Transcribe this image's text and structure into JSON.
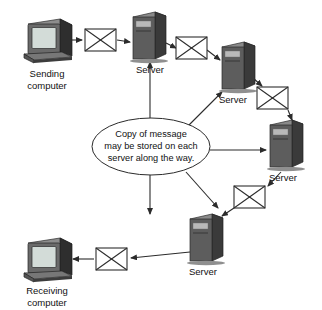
{
  "diagram": {
    "title": "Copy of message may be stored on each server along the way",
    "bubble": {
      "line1": "Copy of message",
      "line2": "may be stored on each",
      "line3": "server along the way."
    },
    "nodes": [
      {
        "id": "sending-computer",
        "type": "computer",
        "label_line1": "Sending",
        "label_line2": "computer"
      },
      {
        "id": "server-1",
        "type": "server",
        "label": "Server"
      },
      {
        "id": "server-2",
        "type": "server",
        "label": "Server"
      },
      {
        "id": "server-3",
        "type": "server",
        "label": "Server"
      },
      {
        "id": "server-4",
        "type": "server",
        "label": "Server"
      },
      {
        "id": "server-5",
        "type": "server",
        "label": "Server"
      },
      {
        "id": "receiving-computer",
        "type": "computer",
        "label_line1": "Receiving",
        "label_line2": "computer"
      }
    ],
    "messages": [
      {
        "id": "envelope-1",
        "icon": "envelope-icon"
      },
      {
        "id": "envelope-2",
        "icon": "envelope-icon"
      },
      {
        "id": "envelope-3",
        "icon": "envelope-icon"
      },
      {
        "id": "envelope-4",
        "icon": "envelope-icon"
      },
      {
        "id": "envelope-5",
        "icon": "envelope-icon"
      }
    ],
    "colors": {
      "background": "#ffffff",
      "stroke": "#2b2b2b",
      "text": "#111111",
      "server_front": "#5d5d5d",
      "server_side": "#3a3a3a",
      "screen": "#d3dcd8"
    }
  }
}
